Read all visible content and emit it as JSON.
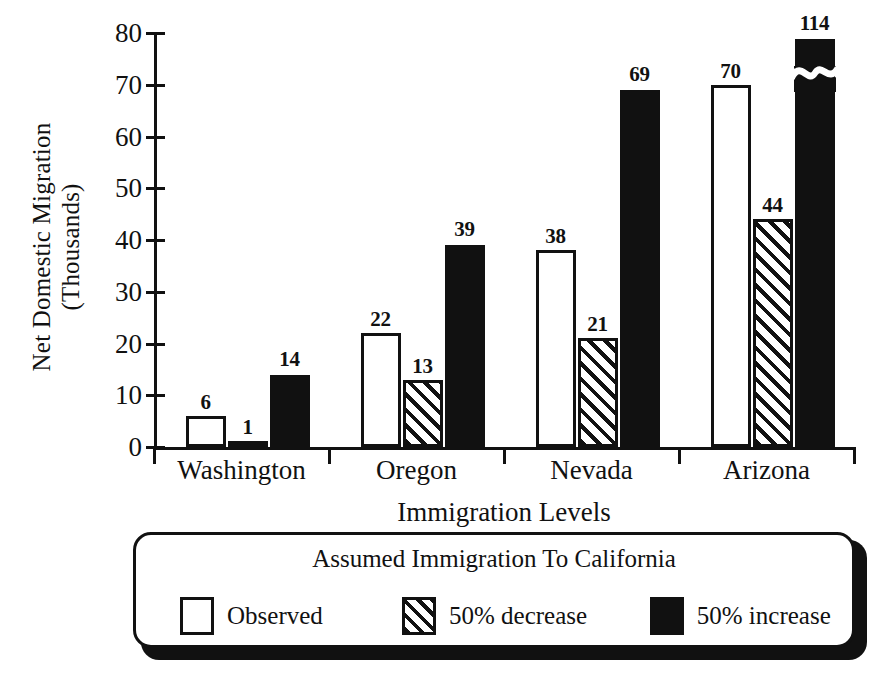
{
  "chart_data": {
    "type": "bar",
    "title": "",
    "xlabel": "Immigration Levels",
    "ylabel": "Net Domestic Migration\n(Thousands)",
    "categories": [
      "Washington",
      "Oregon",
      "Nevada",
      "Arizona"
    ],
    "series": [
      {
        "name": "Observed",
        "key": "observed",
        "swatch": "white-outline",
        "values": [
          6,
          22,
          38,
          70
        ]
      },
      {
        "name": "50% decrease",
        "key": "decrease",
        "swatch": "hatched",
        "values": [
          1,
          13,
          21,
          44
        ]
      },
      {
        "name": "50% increase",
        "key": "increase",
        "swatch": "black-filled",
        "values": [
          14,
          39,
          69,
          114
        ]
      }
    ],
    "ylim": [
      0,
      80
    ],
    "yticks": [
      0,
      10,
      20,
      30,
      40,
      50,
      60,
      70,
      80
    ],
    "grid": false,
    "axis_break": {
      "series": "50% increase",
      "category": "Arizona",
      "value": 114,
      "note": "bar truncated with wavy break mark above the 80 axis maximum"
    },
    "value_labels": true,
    "legend": {
      "position": "below-plot",
      "title": "Assumed Immigration To California",
      "entries": [
        "Observed",
        "50% decrease",
        "50% increase"
      ]
    },
    "colors": {
      "ink": "#111111",
      "background": "#ffffff",
      "observed_fill": "#ffffff",
      "decrease_fill": "#ffffff",
      "decrease_hatch": "#111111",
      "increase_fill": "#111111"
    }
  }
}
